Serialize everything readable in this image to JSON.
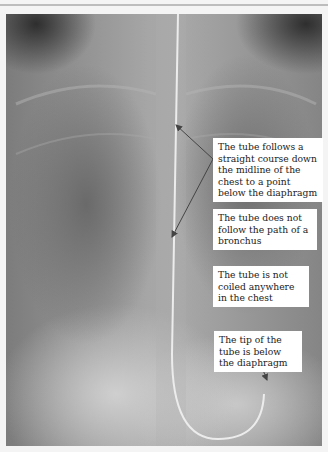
{
  "figure": {
    "labels": [
      "The tube follows a straight course down the midline of the chest to a point below the diaphragm",
      "The tube does not follow the path of a bronchus",
      "The tube is not coiled anywhere in the chest",
      "The tip of the tube is below the diaphragm"
    ],
    "colors": {
      "label_background": "#ffffff",
      "label_text": "#222222",
      "arrow": "#444444",
      "tube": "#e8e8e8"
    }
  }
}
